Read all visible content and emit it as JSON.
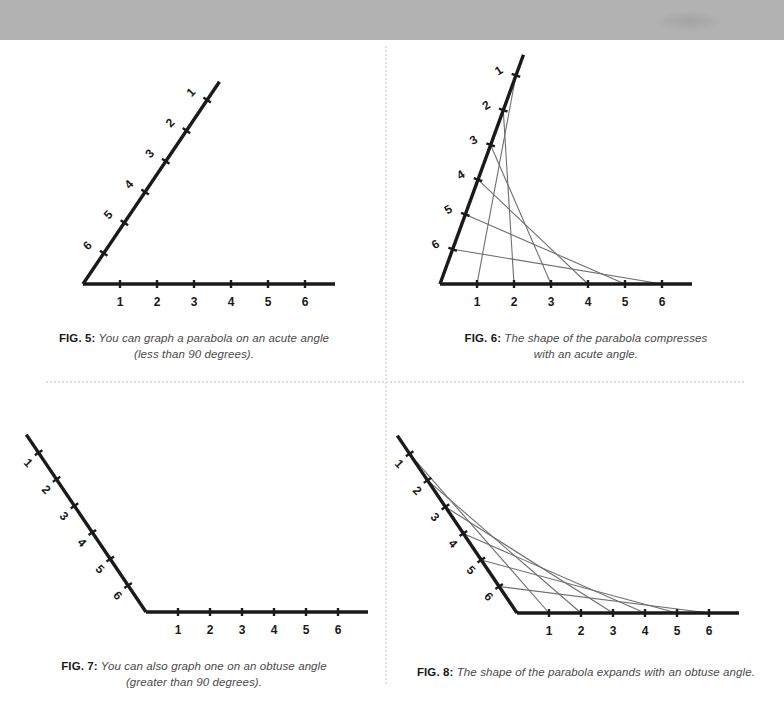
{
  "page": {
    "background_color": "#ffffff",
    "top_band_color": "#b2b2b2",
    "axis_color": "#1a1a1a",
    "envelope_color": "#6e6e6e",
    "caption_color": "#4a4a4a",
    "label_color": "#1a1a1a"
  },
  "figures": [
    {
      "id": "fig5",
      "label": "FIG. 5:",
      "caption_line1": "You can graph a parabola on an acute angle",
      "caption_line2": "(less than 90 degrees).",
      "angle_type": "acute",
      "has_envelope": false,
      "vertex": {
        "x": 83,
        "y": 240
      },
      "horizontal_tick_labels": [
        "1",
        "2",
        "3",
        "4",
        "5",
        "6"
      ],
      "diagonal_tick_labels": [
        "1",
        "2",
        "3",
        "4",
        "5",
        "6"
      ],
      "horizontal_spacing": 37,
      "diagonal_spacing": 37,
      "horizontal_overshoot": 30,
      "diagonal_overshoot": 22,
      "ray_angle_deg": 56
    },
    {
      "id": "fig6",
      "label": "FIG. 6:",
      "caption_line1": "The shape of the parabola compresses",
      "caption_line2": "with an acute angle.",
      "angle_type": "acute",
      "has_envelope": true,
      "vertex": {
        "x": 52,
        "y": 240
      },
      "horizontal_tick_labels": [
        "1",
        "2",
        "3",
        "4",
        "5",
        "6"
      ],
      "diagonal_tick_labels": [
        "1",
        "2",
        "3",
        "4",
        "5",
        "6"
      ],
      "horizontal_spacing": 37,
      "diagonal_spacing": 37,
      "horizontal_overshoot": 30,
      "diagonal_overshoot": 22,
      "ray_angle_deg": 70
    },
    {
      "id": "fig7",
      "label": "FIG. 7:",
      "caption_line1": "You can also graph one on an obtuse angle",
      "caption_line2": "(greater than 90 degrees).",
      "angle_type": "obtuse",
      "has_envelope": false,
      "vertex": {
        "x": 146,
        "y": 222
      },
      "horizontal_tick_labels": [
        "1",
        "2",
        "3",
        "4",
        "5",
        "6"
      ],
      "diagonal_tick_labels": [
        "1",
        "2",
        "3",
        "4",
        "5",
        "6"
      ],
      "horizontal_spacing": 32,
      "diagonal_spacing": 32,
      "horizontal_overshoot": 30,
      "diagonal_overshoot": 22,
      "ray_angle_deg": 124
    },
    {
      "id": "fig8",
      "label": "FIG. 8:",
      "caption_line1": "The shape of the parabola expands with an obtuse angle.",
      "caption_line2": "",
      "angle_type": "obtuse",
      "has_envelope": true,
      "vertex": {
        "x": 129,
        "y": 223
      },
      "horizontal_tick_labels": [
        "1",
        "2",
        "3",
        "4",
        "5",
        "6"
      ],
      "diagonal_tick_labels": [
        "1",
        "2",
        "3",
        "4",
        "5",
        "6"
      ],
      "horizontal_spacing": 32,
      "diagonal_spacing": 32,
      "horizontal_overshoot": 30,
      "diagonal_overshoot": 22,
      "ray_angle_deg": 124
    }
  ],
  "chart_data": {
    "type": "line",
    "xlabel": "",
    "ylabel": "",
    "series": [
      {
        "name": "FIG. 5 acute angle rays",
        "envelope_chords": [],
        "horizontal_points": [
          1,
          2,
          3,
          4,
          5,
          6
        ],
        "diagonal_points": [
          1,
          2,
          3,
          4,
          5,
          6
        ]
      },
      {
        "name": "FIG. 6 acute angle envelope",
        "envelope_chords": [
          [
            1,
            1
          ],
          [
            2,
            2
          ],
          [
            3,
            3
          ],
          [
            4,
            4
          ],
          [
            5,
            5
          ],
          [
            6,
            6
          ]
        ],
        "horizontal_points": [
          1,
          2,
          3,
          4,
          5,
          6
        ],
        "diagonal_points": [
          1,
          2,
          3,
          4,
          5,
          6
        ]
      },
      {
        "name": "FIG. 7 obtuse angle rays",
        "envelope_chords": [],
        "horizontal_points": [
          1,
          2,
          3,
          4,
          5,
          6
        ],
        "diagonal_points": [
          1,
          2,
          3,
          4,
          5,
          6
        ]
      },
      {
        "name": "FIG. 8 obtuse angle envelope",
        "envelope_chords": [
          [
            1,
            1
          ],
          [
            2,
            2
          ],
          [
            3,
            3
          ],
          [
            4,
            4
          ],
          [
            5,
            5
          ],
          [
            6,
            6
          ]
        ],
        "horizontal_points": [
          1,
          2,
          3,
          4,
          5,
          6
        ],
        "diagonal_points": [
          1,
          2,
          3,
          4,
          5,
          6
        ]
      }
    ]
  }
}
